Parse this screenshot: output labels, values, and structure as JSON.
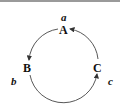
{
  "diagram": {
    "type": "cycle",
    "nodes": [
      {
        "id": "A",
        "label": "A",
        "annotation": "a"
      },
      {
        "id": "B",
        "label": "B",
        "annotation": "b"
      },
      {
        "id": "C",
        "label": "C",
        "annotation": "c"
      }
    ],
    "edges": [
      {
        "from": "A",
        "to": "B"
      },
      {
        "from": "B",
        "to": "C"
      },
      {
        "from": "C",
        "to": "A"
      }
    ],
    "colors": {
      "stroke": "#333333",
      "text": "#111111",
      "border": "#9a9a9a"
    }
  }
}
